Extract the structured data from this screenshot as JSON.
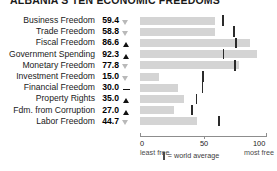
{
  "title": "ALBANIA'S TEN ECONOMIC FREEDOMS",
  "chart_data": {
    "type": "bar",
    "title": "ALBANIA'S TEN ECONOMIC FREEDOMS",
    "xlabel": "",
    "ylabel": "",
    "xlim": [
      0,
      100
    ],
    "grid": false,
    "legend_position": "bottom",
    "categories": [
      "Business Freedom",
      "Trade Freedom",
      "Fiscal Freedom",
      "Government Spending",
      "Monetary Freedom",
      "Investment Freedom",
      "Financial Freedom",
      "Property Rights",
      "Fdm. from Corruption",
      "Labor Freedom"
    ],
    "values": [
      59.4,
      58.8,
      86.6,
      92.3,
      77.8,
      15.0,
      30.0,
      35.0,
      27.0,
      44.7
    ],
    "markers": [
      "down",
      "down",
      "up",
      "up",
      "down",
      "down",
      "dash",
      "up",
      "up",
      "down"
    ],
    "world_average": [
      64.6,
      73.2,
      74.9,
      65.0,
      74.2,
      49.0,
      48.5,
      43.8,
      40.5,
      61.5
    ],
    "axis": {
      "ticks": [
        "0",
        "50",
        "100"
      ],
      "tick_values": [
        0,
        50,
        100
      ],
      "min_sublabel": "least free",
      "max_sublabel": "most free"
    },
    "legend": {
      "symbol": "|",
      "text": "= world average"
    }
  },
  "rows": [
    {
      "label": "Business Freedom",
      "value": "59.4",
      "marker": "down",
      "bar": 59.4,
      "avg": 64.6
    },
    {
      "label": "Trade Freedom",
      "value": "58.8",
      "marker": "down",
      "bar": 58.8,
      "avg": 73.2
    },
    {
      "label": "Fiscal Freedom",
      "value": "86.6",
      "marker": "up",
      "bar": 86.6,
      "avg": 74.9
    },
    {
      "label": "Government Spending",
      "value": "92.3",
      "marker": "up",
      "bar": 92.3,
      "avg": 65.0
    },
    {
      "label": "Monetary Freedom",
      "value": "77.8",
      "marker": "down",
      "bar": 77.8,
      "avg": 74.2
    },
    {
      "label": "Investment Freedom",
      "value": "15.0",
      "marker": "down",
      "bar": 15.0,
      "avg": 49.0
    },
    {
      "label": "Financial Freedom",
      "value": "30.0",
      "marker": "dash",
      "bar": 30.0,
      "avg": 48.5
    },
    {
      "label": "Property Rights",
      "value": "35.0",
      "marker": "up",
      "bar": 35.0,
      "avg": 43.8
    },
    {
      "label": "Fdm. from Corruption",
      "value": "27.0",
      "marker": "up",
      "bar": 27.0,
      "avg": 40.5
    },
    {
      "label": "Labor Freedom",
      "value": "44.7",
      "marker": "down",
      "bar": 44.7,
      "avg": 61.5
    }
  ],
  "axis": {
    "tick0": "0",
    "tick50": "50",
    "tick100": "100",
    "sub_min": "least free",
    "sub_max": "most free"
  },
  "legend": {
    "text": "= world average"
  },
  "colors": {
    "bar": "#d4d4d4",
    "average_tick": "#2b2b2b",
    "marker_up": "#111111",
    "marker_down": "#b9b9b9",
    "axis": "#8d8d8d",
    "text": "#1a1a1a"
  }
}
